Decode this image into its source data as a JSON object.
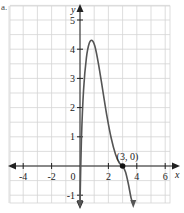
{
  "corner_label": "a.",
  "chart_data": {
    "type": "line",
    "title": "",
    "xlabel": "x",
    "ylabel": "y",
    "xlim": [
      -5,
      6.5
    ],
    "ylim": [
      -1.3,
      5.3
    ],
    "grid": true,
    "x_ticks": [
      -4,
      -2,
      0,
      2,
      4,
      6
    ],
    "x_tick_labels": [
      "-4",
      "-2",
      "0",
      "2",
      "4",
      "6"
    ],
    "y_ticks": [
      -1,
      1,
      2,
      3,
      4,
      5
    ],
    "y_tick_labels": [
      "-1",
      "1",
      "2",
      "3",
      "4",
      "5"
    ],
    "series": [
      {
        "name": "f(x)",
        "color": "#555555",
        "points": [
          [
            0.0,
            -1.3
          ],
          [
            0.1,
            0.9
          ],
          [
            0.25,
            2.6
          ],
          [
            0.45,
            3.7
          ],
          [
            0.65,
            4.2
          ],
          [
            0.85,
            4.3
          ],
          [
            1.05,
            4.1
          ],
          [
            1.3,
            3.5
          ],
          [
            1.6,
            2.6
          ],
          [
            1.9,
            1.7
          ],
          [
            2.2,
            0.95
          ],
          [
            2.5,
            0.4
          ],
          [
            2.75,
            0.12
          ],
          [
            3.0,
            0.0
          ],
          [
            3.2,
            -0.2
          ],
          [
            3.4,
            -0.6
          ],
          [
            3.6,
            -1.1
          ],
          [
            3.75,
            -1.3
          ]
        ]
      }
    ],
    "annotations": [
      {
        "text": "(3, 0)",
        "x": 3,
        "y": 0,
        "marker": "dot"
      }
    ]
  }
}
